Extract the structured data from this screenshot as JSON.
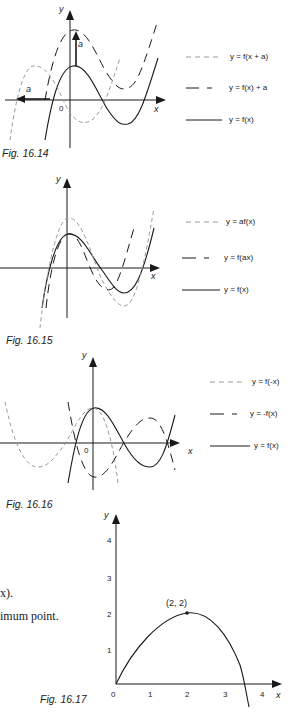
{
  "figures": [
    {
      "caption": "Fig. 16.14",
      "axis_x": "x",
      "axis_y": "y",
      "origin_label": "0",
      "shift_label_up": "a",
      "shift_label_left": "a",
      "legend": [
        {
          "style": "dashed-light",
          "label": "y = f(x + a)"
        },
        {
          "style": "long-dash",
          "label": "y = f(x) + a"
        },
        {
          "style": "solid",
          "label": "y = f(x)"
        }
      ]
    },
    {
      "caption": "Fig. 16.15",
      "axis_x": "x",
      "axis_y": "y",
      "legend": [
        {
          "style": "dashed-light",
          "label": "y = af(x)"
        },
        {
          "style": "long-dash",
          "label": "y = f(ax)"
        },
        {
          "style": "solid",
          "label": "y = f(x)"
        }
      ]
    },
    {
      "caption": "Fig. 16.16",
      "axis_x": "x",
      "axis_y": "y",
      "origin_label": "0",
      "legend": [
        {
          "style": "dashed-light",
          "label": "y = f(-x)"
        },
        {
          "style": "long-dash",
          "label": "y = -f(x)"
        },
        {
          "style": "solid",
          "label": "y = f(x)"
        }
      ]
    },
    {
      "caption": "Fig. 16.17",
      "axis_x": "x",
      "axis_y": "y",
      "x_ticks": [
        "0",
        "1",
        "2",
        "3",
        "4"
      ],
      "y_ticks": [
        "1",
        "2",
        "3",
        "4"
      ],
      "point_label": "(2, 2)"
    }
  ],
  "body_text": {
    "line1": "x).",
    "line2": "imum point."
  },
  "colors": {
    "ink": "#1a1a1a",
    "light_dash": "#9a9a9a"
  }
}
